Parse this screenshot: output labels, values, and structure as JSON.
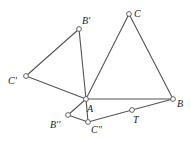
{
  "figure": {
    "type": "geometry-construction",
    "points": [
      {
        "id": "C",
        "label": "C",
        "x": 129,
        "y": 14,
        "lx": 134,
        "ly": 17
      },
      {
        "id": "Bp",
        "label": "B′",
        "x": 79,
        "y": 29,
        "lx": 82,
        "ly": 24
      },
      {
        "id": "Cp",
        "label": "C′",
        "x": 26,
        "y": 76,
        "lx": 8,
        "ly": 84
      },
      {
        "id": "A",
        "label": "A",
        "x": 86,
        "y": 99,
        "lx": 87,
        "ly": 112
      },
      {
        "id": "B",
        "label": "B",
        "x": 173,
        "y": 99,
        "lx": 177,
        "ly": 107
      },
      {
        "id": "T",
        "label": "T",
        "x": 132,
        "y": 110,
        "lx": 133,
        "ly": 123
      },
      {
        "id": "Bpp",
        "label": "B′′",
        "x": 68,
        "y": 115,
        "lx": 50,
        "ly": 128
      },
      {
        "id": "Cpp",
        "label": "C′′",
        "x": 88,
        "y": 122,
        "lx": 91,
        "ly": 133
      }
    ],
    "segments": [
      [
        "A",
        "C"
      ],
      [
        "C",
        "B"
      ],
      [
        "A",
        "B"
      ],
      [
        "A",
        "Bp"
      ],
      [
        "Bp",
        "Cp"
      ],
      [
        "Cp",
        "A"
      ],
      [
        "A",
        "Bpp"
      ],
      [
        "Bpp",
        "Cpp"
      ],
      [
        "Cpp",
        "A"
      ],
      [
        "Cpp",
        "T"
      ],
      [
        "T",
        "B"
      ]
    ],
    "colors": {
      "line": "#555555",
      "point_fill": "#ffffff",
      "label": "#222222"
    }
  }
}
